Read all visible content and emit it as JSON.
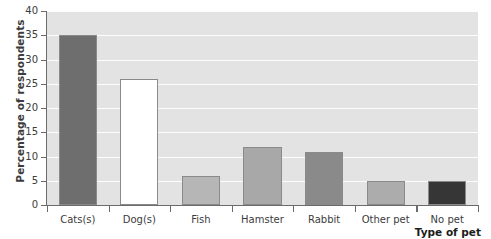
{
  "chart_data": {
    "type": "bar",
    "title": "",
    "xlabel": "Type of pet",
    "ylabel": "Percentage of respondents",
    "categories": [
      "Cats(s)",
      "Dog(s)",
      "Fish",
      "Hamster",
      "Rabbit",
      "Other pet",
      "No pet"
    ],
    "values": [
      35,
      26,
      6,
      12,
      11,
      5,
      5
    ],
    "bar_colors": [
      "#6e6e6e",
      "#ffffff",
      "#b6b6b6",
      "#a8a8a8",
      "#8a8a8a",
      "#acacac",
      "#363636"
    ],
    "ylim": [
      0,
      40
    ],
    "ytick_labels": [
      "0",
      "5",
      "10",
      "15",
      "20",
      "25",
      "30",
      "35",
      "40"
    ],
    "ytick_values": [
      0,
      5,
      10,
      15,
      20,
      25,
      30,
      35,
      40
    ],
    "grid": true,
    "legend": "none",
    "plot_background": "#e3e3e3",
    "gridline_color": "#fdfdfd",
    "axis_color": "#6b6b6b",
    "text_color": "#3c3c3c"
  }
}
